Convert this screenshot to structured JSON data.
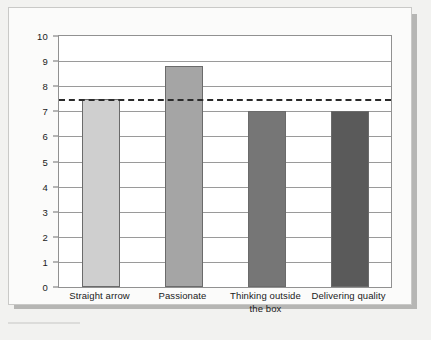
{
  "chart_data": {
    "type": "bar",
    "title": "",
    "subtitle": "",
    "xlabel": "",
    "ylabel": "",
    "categories": [
      "Straight arrow",
      "Passionate",
      "Thinking outside the box",
      "Delivering quality"
    ],
    "values": [
      7.5,
      8.8,
      7.0,
      7.0
    ],
    "bar_colors": [
      "#cfcfcf",
      "#a5a5a5",
      "#767676",
      "#5a5a5a"
    ],
    "ylim": [
      0,
      10
    ],
    "ytick_labels": [
      "0",
      "1",
      "2",
      "3",
      "4",
      "5",
      "6",
      "7",
      "8",
      "9",
      "10"
    ],
    "ytick_values": [
      0,
      1,
      2,
      3,
      4,
      5,
      6,
      7,
      8,
      9,
      10
    ],
    "grid": true,
    "grid_orientation": "horizontal",
    "legend": false,
    "legend_position": "none",
    "annotations": [
      {
        "name": "average-reference-line",
        "type": "horizontal-dashed-line",
        "value": 7.5,
        "color": "#2b2b2b",
        "style": "dashed"
      }
    ]
  },
  "figure": {
    "background_color": "#f2f2f0",
    "card_color": "#fbfbfa",
    "plot_background": "#ffffff",
    "border_color": "#919191",
    "gridline_color": "#9a9a9a",
    "shadow_color": "#b6b6b4"
  }
}
